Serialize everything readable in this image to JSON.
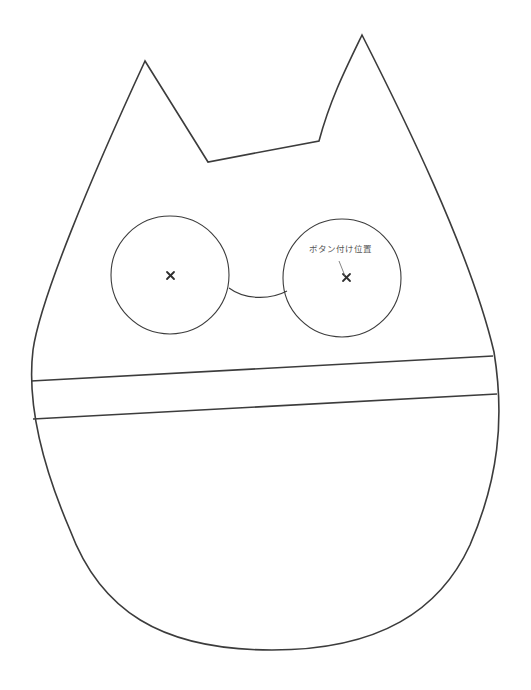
{
  "diagram": {
    "type": "sewing-pattern",
    "annotation": {
      "label": "ボタン付け位置"
    },
    "colors": {
      "stroke": "#3c3c3c",
      "label": "#555555",
      "background": "#ffffff"
    },
    "parts": [
      {
        "name": "body-outline",
        "description": "cat head outline with two ears"
      },
      {
        "name": "left-eye-circle",
        "center": [
          172,
          275
        ],
        "radius": 60
      },
      {
        "name": "right-eye-circle",
        "center": [
          347,
          280
        ],
        "radius": 60
      },
      {
        "name": "nose-bridge-arc"
      },
      {
        "name": "band-line-top"
      },
      {
        "name": "band-line-bottom"
      }
    ]
  }
}
